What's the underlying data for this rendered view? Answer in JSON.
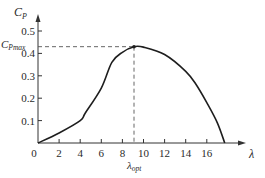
{
  "chart_data": {
    "type": "line",
    "title": "",
    "xlabel": "λ",
    "ylabel": "C_P",
    "ylabel_main": "C",
    "ylabel_sub": "P",
    "xlim": [
      0,
      18.5
    ],
    "ylim": [
      0,
      0.52
    ],
    "grid": false,
    "legend": "none",
    "x_ticks": [
      0,
      2,
      4,
      6,
      8,
      10,
      12,
      14,
      16
    ],
    "x_tick_labels": [
      "0",
      "2",
      "4",
      "6",
      "8",
      "10",
      "12",
      "14",
      "16"
    ],
    "y_ticks": [
      0.1,
      0.2,
      0.3,
      0.4,
      0.5
    ],
    "y_tick_labels": [
      "0.1",
      "0.2",
      "0.3",
      "0.4",
      "0.5"
    ],
    "series": [
      {
        "name": "C_P(λ)",
        "x": [
          0,
          2,
          4,
          4.5,
          6,
          7,
          8,
          9.1,
          10,
          12,
          14,
          15,
          16,
          17,
          17.7
        ],
        "y": [
          0,
          0.045,
          0.1,
          0.135,
          0.245,
          0.36,
          0.405,
          0.43,
          0.428,
          0.395,
          0.32,
          0.26,
          0.18,
          0.09,
          0
        ]
      }
    ],
    "annotations": [
      {
        "type": "optimum-point",
        "x": 9.1,
        "y": 0.43,
        "x_label_main": "λ",
        "x_label_sub": "opt",
        "y_label_main": "C",
        "y_label_sub": "Pmax"
      }
    ]
  }
}
